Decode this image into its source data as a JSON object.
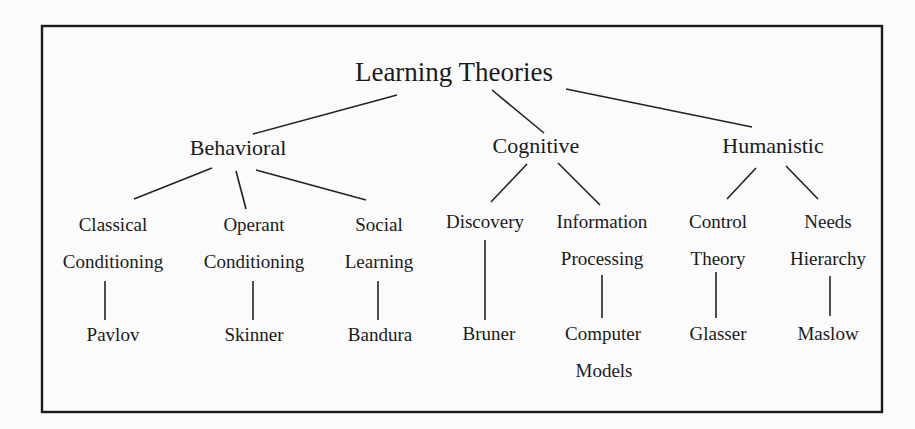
{
  "diagram": {
    "type": "tree",
    "root": {
      "label": "Learning Theories"
    },
    "categories": [
      {
        "label": "Behavioral",
        "children": [
          {
            "label_lines": [
              "Classical",
              "Conditioning"
            ],
            "theorist_lines": [
              "Pavlov"
            ]
          },
          {
            "label_lines": [
              "Operant",
              "Conditioning"
            ],
            "theorist_lines": [
              "Skinner"
            ]
          },
          {
            "label_lines": [
              "Social",
              "Learning"
            ],
            "theorist_lines": [
              "Bandura"
            ]
          }
        ]
      },
      {
        "label": "Cognitive",
        "children": [
          {
            "label_lines": [
              "Discovery"
            ],
            "theorist_lines": [
              "Bruner"
            ]
          },
          {
            "label_lines": [
              "Information",
              "Processing"
            ],
            "theorist_lines": [
              "Computer",
              "Models"
            ]
          }
        ]
      },
      {
        "label": "Humanistic",
        "children": [
          {
            "label_lines": [
              "Control",
              "Theory"
            ],
            "theorist_lines": [
              "Glasser"
            ]
          },
          {
            "label_lines": [
              "Needs",
              "Hierarchy"
            ],
            "theorist_lines": [
              "Maslow"
            ]
          }
        ]
      }
    ]
  },
  "colors": {
    "background": "#fbfbfb",
    "ink": "#1a1a1a",
    "border": "#1a1a1a"
  }
}
